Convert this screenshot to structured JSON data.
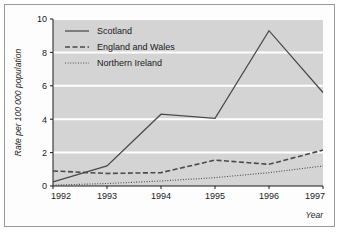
{
  "chart_data": {
    "type": "line",
    "title": "",
    "xlabel": "Year",
    "ylabel": "Rate per 100 000 population",
    "categories": [
      "1992",
      "1993",
      "1994",
      "1995",
      "1996",
      "1997"
    ],
    "x": [
      1992,
      1993,
      1994,
      1995,
      1996,
      1997
    ],
    "xlim": [
      1992,
      1997
    ],
    "ylim": [
      0,
      10
    ],
    "yticks": [
      "0",
      "2",
      "4",
      "6",
      "8",
      "10"
    ],
    "ytick_values": [
      0,
      2,
      4,
      6,
      8,
      10
    ],
    "grid": "horizontal",
    "legend_position": "top-left-inside",
    "plot_background": "#d4d4d4",
    "gridline_color": "#ffffff",
    "line_color": "#4a4a4a",
    "series": [
      {
        "name": "Scotland",
        "style": "solid",
        "values": [
          0.25,
          1.2,
          4.3,
          4.05,
          9.3,
          5.6
        ]
      },
      {
        "name": "England and Wales",
        "style": "dashed",
        "values": [
          0.9,
          0.75,
          0.8,
          1.55,
          1.3,
          2.15
        ]
      },
      {
        "name": "Northern Ireland",
        "style": "dotted",
        "values": [
          0.05,
          0.15,
          0.3,
          0.5,
          0.8,
          1.2
        ]
      }
    ]
  }
}
